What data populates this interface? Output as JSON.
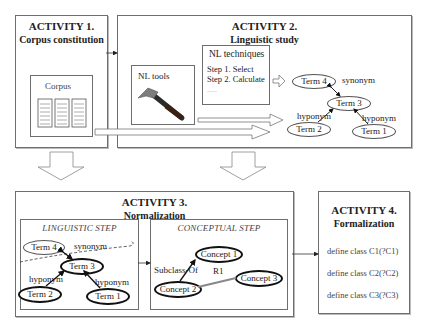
{
  "activity1": {
    "title": "ACTIVITY 1.",
    "subtitle": "Corpus constitution",
    "corpus_label": "Corpus",
    "icon": "document-stack-icon"
  },
  "activity2": {
    "title": "ACTIVITY 2.",
    "subtitle": "Linguistic study",
    "nl_tools_label": "NL tools",
    "tool_icon": "hammer-icon",
    "nl_techniques": {
      "label": "NL techniques",
      "steps": [
        "Step 1. Select",
        "Step 2. Calculate",
        "....."
      ]
    },
    "graph": {
      "nodes": [
        "Term 4",
        "Term 3",
        "Term 2",
        "Term 1"
      ],
      "edges": [
        {
          "label": "synonym",
          "from": "Term 4",
          "to": "Term 3"
        },
        {
          "label": "hyponym",
          "from": "Term 2",
          "to": "Term 3"
        },
        {
          "label": "hyponym",
          "from": "Term 1",
          "to": "Term 3"
        }
      ]
    }
  },
  "activity3": {
    "title": "ACTIVITY 3.",
    "subtitle": "Normalization",
    "linguistic_step": {
      "label": "LINGUISTIC STEP",
      "nodes": [
        "Term 4",
        "Term 3",
        "Term 2",
        "Term 1"
      ],
      "edge_labels": [
        "synonym",
        "hyponym",
        "hyponym"
      ]
    },
    "conceptual_step": {
      "label": "CONCEPTUAL STEP",
      "nodes": [
        "Concept 1",
        "Concept 2",
        "Concept 3"
      ],
      "edge_labels": [
        "Subclass-Of",
        "R1"
      ]
    }
  },
  "activity4": {
    "title": "ACTIVITY 4.",
    "subtitle": "Formalization",
    "definitions": [
      "define class C1(?C1)",
      "define class C2(?C2)",
      "define class C3(?C3)"
    ]
  }
}
